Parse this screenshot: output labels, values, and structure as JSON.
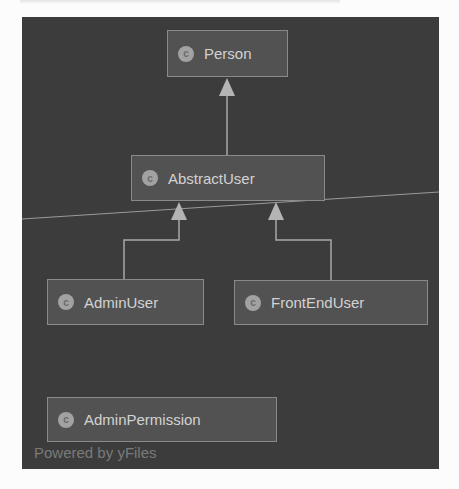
{
  "diagram": {
    "nodes": {
      "person": {
        "label": "Person",
        "icon": "class-icon",
        "icon_glyph": "c"
      },
      "abstract_user": {
        "label": "AbstractUser",
        "icon": "class-icon",
        "icon_glyph": "c"
      },
      "admin_user": {
        "label": "AdminUser",
        "icon": "class-icon",
        "icon_glyph": "c"
      },
      "front_end_user": {
        "label": "FrontEndUser",
        "icon": "class-icon",
        "icon_glyph": "c"
      },
      "admin_permission": {
        "label": "AdminPermission",
        "icon": "class-icon",
        "icon_glyph": "c"
      }
    },
    "edges": [
      {
        "from": "AbstractUser",
        "to": "Person",
        "type": "inheritance"
      },
      {
        "from": "AdminUser",
        "to": "AbstractUser",
        "type": "inheritance"
      },
      {
        "from": "FrontEndUser",
        "to": "AbstractUser",
        "type": "inheritance"
      }
    ],
    "watermark": "Powered by yFiles"
  },
  "colors": {
    "canvas_bg": "#3c3c3c",
    "node_bg": "#525252",
    "node_border": "#8a8a8a",
    "edge": "#a8a8a8",
    "text": "#d2d2d2"
  }
}
